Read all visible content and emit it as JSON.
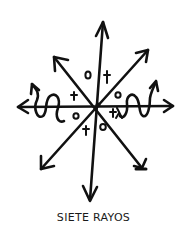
{
  "caption": "SIETE RAYOS",
  "colors": {
    "ink": "#111111",
    "background": "#ffffff"
  },
  "symbol": {
    "name": "siete-rayos",
    "rays": [
      {
        "direction": "up",
        "type": "straight-arrow"
      },
      {
        "direction": "down",
        "type": "straight-arrow"
      },
      {
        "direction": "left",
        "type": "straight-arrow"
      },
      {
        "direction": "right",
        "type": "straight-arrow"
      },
      {
        "direction": "up-left",
        "type": "straight-arrow"
      },
      {
        "direction": "up-right",
        "type": "straight-arrow"
      },
      {
        "direction": "down-left",
        "type": "straight-arrow"
      },
      {
        "direction": "down-right",
        "type": "straight-arrow"
      },
      {
        "direction": "left",
        "type": "wavy-arrow"
      },
      {
        "direction": "right",
        "type": "wavy-arrow"
      }
    ],
    "marks": [
      {
        "glyph": "0",
        "position": "upper-left-sector"
      },
      {
        "glyph": "†",
        "position": "upper-right-sector"
      },
      {
        "glyph": "†",
        "position": "left-upper-sector"
      },
      {
        "glyph": "o",
        "position": "right-upper-sector"
      },
      {
        "glyph": "o",
        "position": "left-lower-sector"
      },
      {
        "glyph": "+λ",
        "position": "right-lower-sector"
      },
      {
        "glyph": "†",
        "position": "lower-left-sector"
      },
      {
        "glyph": "o",
        "position": "lower-right-sector"
      }
    ]
  }
}
